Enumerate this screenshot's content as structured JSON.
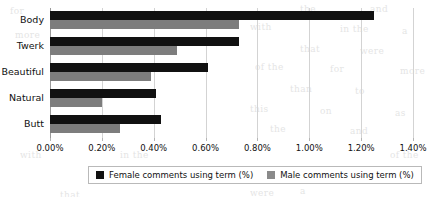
{
  "chart_data": {
    "type": "bar",
    "orientation": "horizontal",
    "title": "",
    "xlabel": "",
    "ylabel": "",
    "categories": [
      "Body",
      "Twerk",
      "Beautiful",
      "Natural",
      "Butt"
    ],
    "series": [
      {
        "name": "Female comments using term (%)",
        "color": "#111111",
        "values": [
          1.25,
          0.73,
          0.61,
          0.41,
          0.43
        ]
      },
      {
        "name": "Male comments using term (%)",
        "color": "#7d7d7d",
        "values": [
          0.73,
          0.49,
          0.39,
          0.2,
          0.27
        ]
      }
    ],
    "xlim": [
      0,
      1.4
    ],
    "xticks": [
      "0.00%",
      "0.20%",
      "0.40%",
      "0.60%",
      "0.80%",
      "1.00%",
      "1.20%",
      "1.40%"
    ],
    "xtick_values": [
      0,
      0.2,
      0.4,
      0.6,
      0.8,
      1.0,
      1.2,
      1.4
    ],
    "grid": true,
    "legend_position": "bottom"
  },
  "legend": {
    "items": [
      {
        "label": "Female comments using term (%)"
      },
      {
        "label": "Male comments using term (%)"
      }
    ]
  },
  "background_text": [
    "the",
    "and",
    "with",
    "in the",
    "a",
    "that",
    "were",
    "of the",
    "for",
    "more",
    "than",
    "to",
    "this",
    "on",
    "as"
  ]
}
